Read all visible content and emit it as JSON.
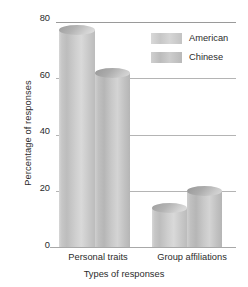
{
  "chart_data": {
    "type": "bar",
    "title": "",
    "subtitle": "",
    "xlabel": "Types of responses",
    "ylabel": "Percentage of responses",
    "categories": [
      "Personal traits",
      "Group affiliations"
    ],
    "series": [
      {
        "name": "American",
        "values": [
          77,
          14
        ],
        "color": "#c9c9c9"
      },
      {
        "name": "Chinese",
        "values": [
          62,
          20
        ],
        "color": "#bebebe"
      }
    ],
    "ylim": [
      0,
      80
    ],
    "yticks": [
      0,
      20,
      40,
      60,
      80
    ],
    "ytick_labels": [
      "0",
      "20",
      "40",
      "60",
      "80"
    ],
    "grid": true,
    "grid_axis": "y",
    "legend_position": "top-right",
    "bar_style": "cylinder",
    "gridline_color": "#b4b4b4",
    "background": "#ffffff"
  },
  "axes": {
    "y_title": "Percentage of responses",
    "x_title": "Types of responses",
    "y_ticks": [
      {
        "label": "80",
        "value": 80
      },
      {
        "label": "60",
        "value": 60
      },
      {
        "label": "40",
        "value": 40
      },
      {
        "label": "20",
        "value": 20
      },
      {
        "label": "0",
        "value": 0
      }
    ]
  },
  "legend": {
    "items": [
      {
        "label": "American"
      },
      {
        "label": "Chinese"
      }
    ]
  },
  "groups": [
    {
      "label": "Personal traits",
      "bars": [
        {
          "series": "American",
          "value": 77
        },
        {
          "series": "Chinese",
          "value": 62
        }
      ]
    },
    {
      "label": "Group affiliations",
      "bars": [
        {
          "series": "American",
          "value": 14
        },
        {
          "series": "Chinese",
          "value": 20
        }
      ]
    }
  ]
}
